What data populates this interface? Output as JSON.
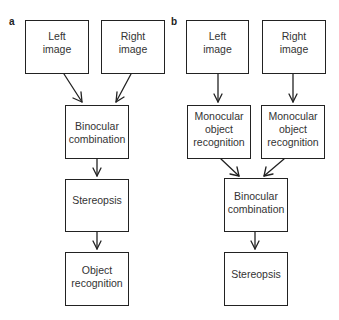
{
  "panels": [
    {
      "label": "a",
      "nodes": {
        "left": "Left\nimage",
        "right": "Right\nimage",
        "binocular": "Binocular\ncombination",
        "stereo": "Stereopsis",
        "object": "Object\nrecognition"
      }
    },
    {
      "label": "b",
      "nodes": {
        "left": "Left\nimage",
        "right": "Right\nimage",
        "mono_left": "Monocular\nobject\nrecognition",
        "mono_right": "Monocular\nobject\nrecognition",
        "binocular": "Binocular\ncombination",
        "stereo": "Stereopsis"
      }
    }
  ]
}
